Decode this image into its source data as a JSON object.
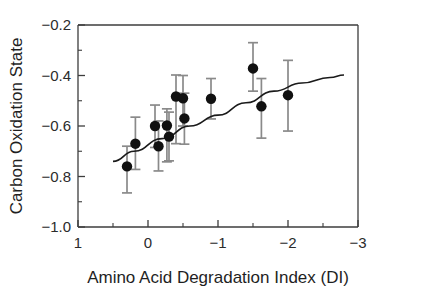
{
  "chart_data": {
    "type": "scatter",
    "title": "",
    "xlabel": "Amino Acid Degradation Index (DI)",
    "ylabel": "Carbon Oxidation State",
    "xlim": [
      1,
      -3
    ],
    "ylim": [
      -1.0,
      -0.2
    ],
    "x_ticks": [
      "1",
      "0",
      "-1",
      "-2",
      "-3"
    ],
    "x_tick_values": [
      1,
      0,
      -1,
      -2,
      -3
    ],
    "x_minor_per_interval": 1,
    "y_ticks": [
      "-0.2",
      "-0.4",
      "-0.6",
      "-0.8",
      "-1.0"
    ],
    "y_tick_values": [
      -0.2,
      -0.4,
      -0.6,
      -0.8,
      -1.0
    ],
    "y_minor_per_interval": 1,
    "grid": false,
    "legend": false,
    "x_axis_reversed": true,
    "marker": "filled-circle",
    "marker_color": "#111111",
    "errorbar_color": "#8a8a8a",
    "trendline_color": "#1a1a1a",
    "points": [
      {
        "x": 0.3,
        "y": -0.76,
        "yerr_low": -0.865,
        "yerr_high": -0.68
      },
      {
        "x": 0.18,
        "y": -0.67,
        "yerr_low": -0.772,
        "yerr_high": -0.565
      },
      {
        "x": -0.1,
        "y": -0.6,
        "yerr_low": -0.685,
        "yerr_high": -0.517
      },
      {
        "x": -0.15,
        "y": -0.68,
        "yerr_low": -0.778,
        "yerr_high": -0.58
      },
      {
        "x": -0.27,
        "y": -0.598,
        "yerr_low": -0.742,
        "yerr_high": -0.532
      },
      {
        "x": -0.3,
        "y": -0.642,
        "yerr_low": -0.738,
        "yerr_high": -0.545
      },
      {
        "x": -0.4,
        "y": -0.483,
        "yerr_low": -0.67,
        "yerr_high": -0.398
      },
      {
        "x": -0.5,
        "y": -0.49,
        "yerr_low": -0.6,
        "yerr_high": -0.4
      },
      {
        "x": -0.52,
        "y": -0.57,
        "yerr_low": -0.672,
        "yerr_high": -0.47
      },
      {
        "x": -0.9,
        "y": -0.492,
        "yerr_low": -0.572,
        "yerr_high": -0.412
      },
      {
        "x": -1.5,
        "y": -0.372,
        "yerr_low": -0.462,
        "yerr_high": -0.27
      },
      {
        "x": -1.62,
        "y": -0.522,
        "yerr_low": -0.648,
        "yerr_high": -0.412
      },
      {
        "x": -2.0,
        "y": -0.478,
        "yerr_low": -0.62,
        "yerr_high": -0.34
      }
    ],
    "trendline": {
      "description": "fitted curve through data, gently rising from left to right",
      "points": [
        {
          "x": 0.5,
          "y": -0.74
        },
        {
          "x": 0.2,
          "y": -0.7
        },
        {
          "x": -0.2,
          "y": -0.65
        },
        {
          "x": -0.6,
          "y": -0.6
        },
        {
          "x": -1.0,
          "y": -0.557
        },
        {
          "x": -1.4,
          "y": -0.508
        },
        {
          "x": -1.8,
          "y": -0.462
        },
        {
          "x": -2.2,
          "y": -0.43
        },
        {
          "x": -2.6,
          "y": -0.408
        },
        {
          "x": -2.8,
          "y": -0.398
        }
      ]
    }
  }
}
